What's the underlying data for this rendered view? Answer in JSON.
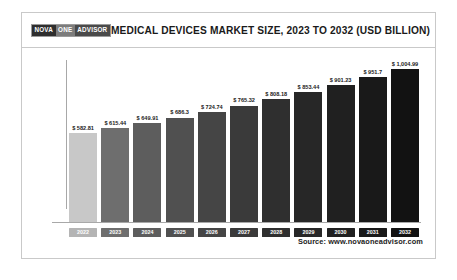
{
  "header": {
    "logo": {
      "part1": "NOVA",
      "part2": "ONE",
      "part3": "ADVISOR"
    },
    "title": "MEDICAL DEVICES MARKET SIZE, 2023 TO 2032 (USD BILLION)"
  },
  "footer": {
    "source": "Source: www.novaoneadvisor.com"
  },
  "colors": {
    "bar_dark": "#1c1c1c",
    "bar_light": "#c8c8c8",
    "frame": "#c9c9c9",
    "axis": "#a8a8a8",
    "text": "#1a1a1a"
  },
  "chart_data": {
    "type": "bar",
    "title": "MEDICAL DEVICES MARKET SIZE, 2023 TO 2032 (USD BILLION)",
    "xlabel": "",
    "ylabel": "",
    "unit": "USD Billion",
    "grid": false,
    "legend": "none",
    "ylim": [
      0,
      1004.99
    ],
    "categories": [
      "2022",
      "2023",
      "2024",
      "2025",
      "2026",
      "2027",
      "2028",
      "2029",
      "2030",
      "2031",
      "2032"
    ],
    "values": [
      582.81,
      615.44,
      649.91,
      686.3,
      724.74,
      765.32,
      808.18,
      853.44,
      901.23,
      951.7,
      1004.99
    ],
    "data_labels": [
      "$ 582.81",
      "$ 615.44",
      "$ 649.91",
      "$ 686.3",
      "$ 724.74",
      "$ 765.32",
      "$ 808.18",
      "$ 853.44",
      "$ 901.23",
      "$ 951.7",
      "$ 1,004.99"
    ],
    "bar_colors": [
      "#c8c8c8",
      "#6e6e6e",
      "#5d5d5d",
      "#505050",
      "#454545",
      "#3a3a3a",
      "#2f2f2f",
      "#272727",
      "#202020",
      "#191919",
      "#121212"
    ],
    "tick_colors": [
      "#b4b4b4",
      "#6e6e6e",
      "#5d5d5d",
      "#505050",
      "#454545",
      "#3a3a3a",
      "#2f2f2f",
      "#272727",
      "#202020",
      "#191919",
      "#121212"
    ]
  }
}
